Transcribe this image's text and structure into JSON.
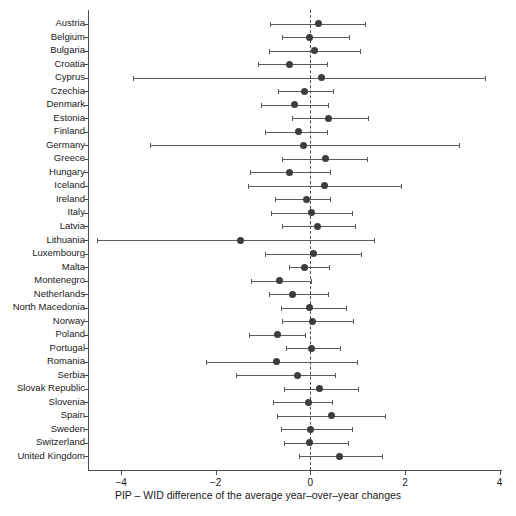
{
  "chart_data": {
    "type": "scatter",
    "title": "",
    "subtitle": "",
    "xlabel": "PIP – WID difference of the average year–over–year changes",
    "ylabel": "",
    "xlim": [
      -4.7,
      4.05
    ],
    "ylim": [
      0,
      38
    ],
    "grid": false,
    "legend": "none",
    "zero_reference_line": 0,
    "xticks": [
      -4,
      -2,
      0,
      2,
      4
    ],
    "xticklabels": [
      "−4",
      "−2",
      "0",
      "2",
      "4"
    ],
    "categories": [
      "Austria",
      "Belgium",
      "Bulgaria",
      "Croatia",
      "Cyprus",
      "Czechia",
      "Denmark",
      "Estonia",
      "Finland",
      "Germany",
      "Greece",
      "Hungary",
      "Iceland",
      "Ireland",
      "Italy",
      "Latvia",
      "Lithuania",
      "Luxembourg",
      "Malta",
      "Montenegro",
      "Netherlands",
      "North Macedonia",
      "Norway",
      "Poland",
      "Portugal",
      "Romania",
      "Serbia",
      "Slovak Republic",
      "Slovenia",
      "Spain",
      "Sweden",
      "Switzerland",
      "United Kingdom"
    ],
    "series": [
      {
        "name": "PIP – WID difference",
        "estimates": [
          0.18,
          -0.02,
          0.08,
          -0.45,
          0.24,
          -0.12,
          -0.33,
          0.38,
          -0.25,
          -0.15,
          0.33,
          -0.45,
          0.3,
          -0.08,
          0.02,
          0.15,
          -1.48,
          0.07,
          -0.12,
          -0.65,
          -0.38,
          -0.02,
          0.04,
          -0.7,
          0.03,
          -0.72,
          -0.28,
          0.2,
          -0.05,
          0.45,
          0.0,
          -0.01,
          0.62
        ],
        "ci_low": [
          -0.85,
          -0.6,
          -0.88,
          -1.1,
          -3.75,
          -0.68,
          -1.05,
          -0.38,
          -0.95,
          -3.4,
          -0.6,
          -1.28,
          -1.32,
          -0.75,
          -0.83,
          -0.6,
          -4.5,
          -0.95,
          -0.45,
          -1.25,
          -0.88,
          -0.62,
          -0.6,
          -1.3,
          -0.52,
          -2.2,
          -1.58,
          -0.55,
          -0.78,
          -0.7,
          -0.62,
          -0.55,
          -0.25
        ],
        "ci_high": [
          1.15,
          0.82,
          1.05,
          0.35,
          3.7,
          0.48,
          0.38,
          1.22,
          0.35,
          3.15,
          1.2,
          0.42,
          1.92,
          0.42,
          0.88,
          0.95,
          1.35,
          1.08,
          0.4,
          0.02,
          0.38,
          0.75,
          0.9,
          -0.12,
          0.62,
          0.98,
          0.52,
          1.0,
          0.45,
          1.58,
          0.88,
          0.8,
          1.52
        ]
      }
    ],
    "marker_color": "#3d3d3d",
    "error_bar_color": "#5a5a5a",
    "zero_line_color": "#4a4a4a",
    "axis_color": "#4d4d4d",
    "background_color": "#ffffff"
  }
}
